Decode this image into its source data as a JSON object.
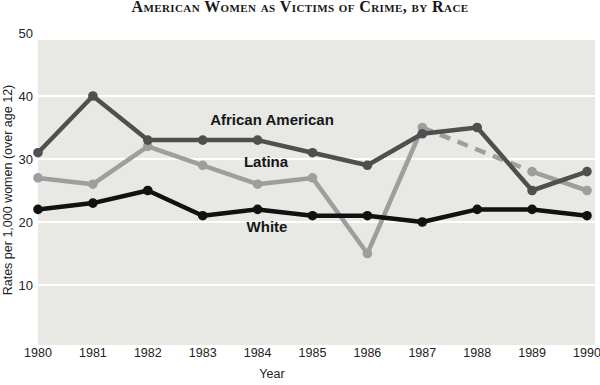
{
  "chart_data": {
    "type": "line",
    "title": "American Women as Victims of Crime, by Race",
    "xlabel": "Year",
    "ylabel": "Rates per 1,000 women (over age 12)",
    "x": [
      1980,
      1981,
      1982,
      1983,
      1984,
      1985,
      1986,
      1987,
      1988,
      1989,
      1990
    ],
    "yticks": [
      10,
      20,
      30,
      40,
      50
    ],
    "ylim": [
      0,
      50
    ],
    "grid": true,
    "legend_position": "inline-labels",
    "plot_bg_color": "#e8e8e5",
    "grid_color": "#ffffff",
    "text_color": "#222222",
    "series": [
      {
        "name": "Latina",
        "color": "#9e9e9e",
        "values": [
          27,
          26,
          32,
          29,
          26,
          27,
          15,
          35,
          null,
          28,
          25
        ],
        "dashed_between": [
          1987,
          1989
        ]
      },
      {
        "name": "African American",
        "color": "#4f4f4f",
        "values": [
          31,
          40,
          33,
          33,
          33,
          31,
          29,
          34,
          35,
          25,
          28
        ]
      },
      {
        "name": "White",
        "color": "#111111",
        "values": [
          22,
          23,
          25,
          21,
          22,
          21,
          21,
          20,
          22,
          22,
          21
        ]
      }
    ]
  }
}
